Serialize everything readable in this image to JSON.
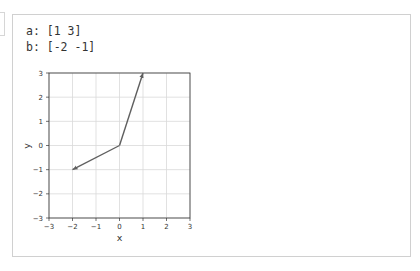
{
  "output": {
    "lines": [
      {
        "label": "a:",
        "value": "[1 3]",
        "text": "a: [1 3]"
      },
      {
        "label": "b:",
        "value": "[-2 -1]",
        "text": "b: [-2 -1]"
      }
    ]
  },
  "chart_data": {
    "type": "line",
    "title": "",
    "xlabel": "x",
    "ylabel": "y",
    "xlim": [
      -3,
      3
    ],
    "ylim": [
      -3,
      3
    ],
    "grid": true,
    "xticks": [
      "−3",
      "−2",
      "−1",
      "0",
      "1",
      "2",
      "3"
    ],
    "yticks": [
      "−3",
      "−2",
      "−1",
      "0",
      "1",
      "2",
      "3"
    ],
    "series": [
      {
        "name": "a",
        "from": [
          0,
          0
        ],
        "to": [
          1,
          3
        ],
        "style": "arrow"
      },
      {
        "name": "b",
        "from": [
          0,
          0
        ],
        "to": [
          -2,
          -1
        ],
        "style": "arrow"
      }
    ],
    "colors": {
      "vector": "#5f5f5f",
      "grid": "#d9d9d9",
      "axes": "#333333"
    }
  }
}
